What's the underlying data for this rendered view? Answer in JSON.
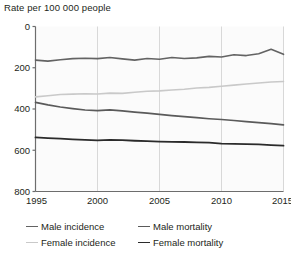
{
  "chart_data": {
    "type": "line",
    "title": "Rate per 100 000 people",
    "xlabel": "",
    "ylabel": "",
    "xlim": [
      1995,
      2015
    ],
    "ylim": [
      0,
      800
    ],
    "yticks": [
      0,
      200,
      400,
      600,
      800
    ],
    "xticks": [
      1995,
      2000,
      2005,
      2010,
      2015
    ],
    "grid": "vertical",
    "legend_position": "bottom",
    "x": [
      1995,
      1996,
      1997,
      1998,
      1999,
      2000,
      2001,
      2002,
      2003,
      2004,
      2005,
      2006,
      2007,
      2008,
      2009,
      2010,
      2011,
      2012,
      2013,
      2014,
      2015
    ],
    "series": [
      {
        "name": "Male incidence",
        "color": "#636363",
        "width": 1.6,
        "values": [
          637,
          632,
          639,
          644,
          646,
          644,
          650,
          643,
          637,
          645,
          641,
          650,
          645,
          648,
          655,
          652,
          663,
          659,
          668,
          690,
          665
        ]
      },
      {
        "name": "Female incidence",
        "color": "#c9c9c9",
        "width": 1.6,
        "values": [
          459,
          464,
          470,
          472,
          474,
          473,
          477,
          476,
          481,
          486,
          488,
          492,
          496,
          502,
          505,
          510,
          516,
          521,
          526,
          531,
          533
        ]
      },
      {
        "name": "Male mortality",
        "color": "#5a5a5a",
        "width": 1.6,
        "values": [
          432,
          420,
          410,
          402,
          395,
          392,
          396,
          391,
          385,
          380,
          374,
          368,
          363,
          358,
          353,
          349,
          344,
          339,
          334,
          329,
          323
        ]
      },
      {
        "name": "Female mortality",
        "color": "#2b2b2b",
        "width": 1.8,
        "values": [
          262,
          259,
          256,
          253,
          250,
          248,
          250,
          249,
          246,
          244,
          242,
          241,
          240,
          238,
          237,
          232,
          231,
          230,
          228,
          225,
          222
        ]
      }
    ]
  },
  "legend": {
    "entries": [
      {
        "label": "Male incidence",
        "color": "#636363",
        "width": 1.6
      },
      {
        "label": "Male mortality",
        "color": "#5a5a5a",
        "width": 1.6
      },
      {
        "label": "Female incidence",
        "color": "#c9c9c9",
        "width": 1.6
      },
      {
        "label": "Female mortality",
        "color": "#2b2b2b",
        "width": 1.8
      }
    ]
  },
  "axes": {
    "y_tick_labels": [
      "800",
      "600",
      "400",
      "200",
      "0"
    ],
    "x_tick_labels": [
      "1995",
      "2000",
      "2005",
      "2010",
      "2015"
    ]
  },
  "colors": {
    "axis": "#6d6d6d",
    "grid": "#d8d8d8",
    "plot_background": "#fbfbfb",
    "text": "#231f20"
  }
}
